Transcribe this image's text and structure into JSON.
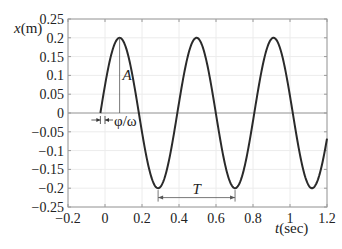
{
  "chart_data": {
    "type": "line",
    "title": "",
    "xlabel": "t(sec)",
    "ylabel": "x(m)",
    "xlim": [
      -0.2,
      1.2
    ],
    "ylim": [
      -0.25,
      0.25
    ],
    "xticks": [
      -0.2,
      0,
      0.2,
      0.4,
      0.6,
      0.8,
      1,
      1.2
    ],
    "xtick_labels": [
      "−0.2",
      "0",
      "0.2",
      "0.4",
      "0.6",
      "0.8",
      "1",
      "1.2"
    ],
    "yticks": [
      0.25,
      0.2,
      0.15,
      0.1,
      0.05,
      0,
      -0.05,
      -0.1,
      -0.15,
      -0.2,
      -0.25
    ],
    "ytick_labels": [
      "0.25",
      "0.2",
      "0.15",
      "0.1",
      "0.05",
      "0",
      "−0.05",
      "−0.1",
      "−0.15",
      "−0.2",
      "−0.25"
    ],
    "grid": true,
    "series": [
      {
        "name": "x(t) = A sin(ωt + φ)",
        "amplitude": 0.2,
        "period": 0.416,
        "t_start": -0.025,
        "t_end": 1.2,
        "peaks_t": [
          0.079,
          0.495,
          0.911
        ],
        "troughs_t": [
          0.287,
          0.703,
          1.119
        ],
        "x": [
          -0.025,
          0.079,
          0.183,
          0.287,
          0.391,
          0.495,
          0.599,
          0.703,
          0.807,
          0.911,
          1.015,
          1.119,
          1.2
        ],
        "y": [
          0,
          0.2,
          0,
          -0.2,
          0,
          0.2,
          0,
          -0.2,
          0,
          0.2,
          0,
          -0.2,
          -0.1
        ]
      }
    ],
    "annotations": [
      {
        "text": "A",
        "kind": "amplitude",
        "at_t": 0.079,
        "from_y": 0,
        "to_y": 0.2
      },
      {
        "text": "φ/ω",
        "kind": "phase-shift",
        "from_t": -0.025,
        "to_t": 0
      },
      {
        "text": "T",
        "kind": "period",
        "from_t": 0.287,
        "to_t": 0.703,
        "at_y": -0.225
      }
    ]
  }
}
